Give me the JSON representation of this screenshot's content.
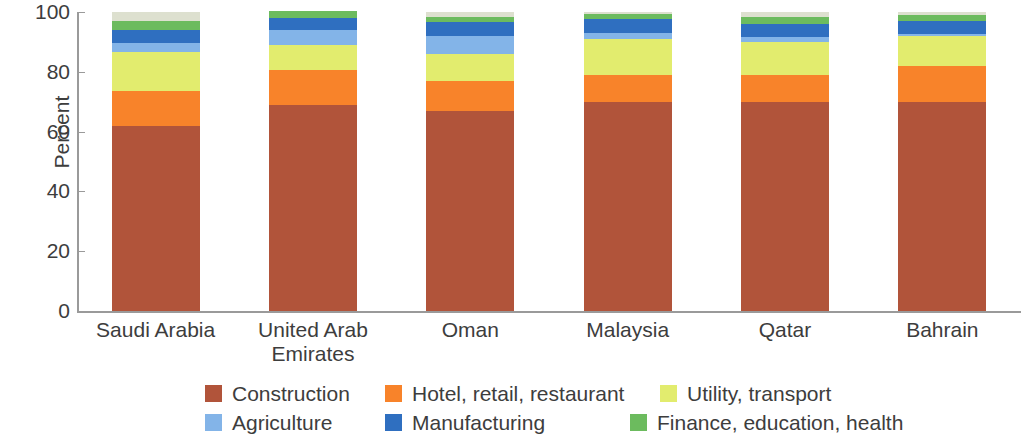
{
  "chart_data": {
    "type": "bar",
    "subtype": "stacked-bar",
    "title": "",
    "xlabel": "",
    "ylabel": "Percent",
    "ylim": [
      0,
      100
    ],
    "yticks": [
      0,
      20,
      40,
      60,
      80,
      100
    ],
    "grid": false,
    "legend_position": "bottom",
    "categories": [
      "Saudi Arabia",
      "United Arab Emirates",
      "Oman",
      "Malaysia",
      "Qatar",
      "Bahrain"
    ],
    "category_display": [
      "Saudi Arabia",
      "United Arab\nEmirates",
      "Oman",
      "Malaysia",
      "Qatar",
      "Bahrain"
    ],
    "series": [
      {
        "name": "Construction",
        "color": "#b1543a",
        "values": [
          62,
          69,
          67,
          70,
          70,
          70
        ]
      },
      {
        "name": "Hotel, retail, restaurant",
        "color": "#f8832a",
        "values": [
          11.5,
          11.5,
          10,
          9,
          9,
          12
        ]
      },
      {
        "name": "Utility, transport",
        "color": "#e2ec6e",
        "values": [
          13,
          8.5,
          9,
          12,
          11,
          10
        ]
      },
      {
        "name": "Agriculture",
        "color": "#83b4e8",
        "values": [
          3,
          5,
          6,
          2,
          1.5,
          0.5
        ]
      },
      {
        "name": "Manufacturing",
        "color": "#2f6fc0",
        "values": [
          4.5,
          4,
          4.5,
          4.5,
          4.5,
          4.5
        ]
      },
      {
        "name": "Finance, education, health",
        "color": "#6cbb5e",
        "values": [
          3,
          2,
          2,
          2,
          2.5,
          2
        ]
      }
    ],
    "remainder": {
      "name": "Other",
      "color": "#dde0cf",
      "values": [
        3,
        0,
        1.5,
        0.5,
        1.5,
        1
      ]
    }
  },
  "legend": {
    "items": [
      {
        "label": "Construction",
        "color": "#b1543a"
      },
      {
        "label": "Hotel, retail, restaurant",
        "color": "#f8832a"
      },
      {
        "label": "Utility, transport",
        "color": "#e2ec6e"
      },
      {
        "label": "Agriculture",
        "color": "#83b4e8"
      },
      {
        "label": "Manufacturing",
        "color": "#2f6fc0"
      },
      {
        "label": "Finance, education, health",
        "color": "#6cbb5e"
      }
    ]
  },
  "axis": {
    "y_title": "Percent",
    "y_ticks": [
      "0",
      "20",
      "40",
      "60",
      "80",
      "100"
    ]
  }
}
